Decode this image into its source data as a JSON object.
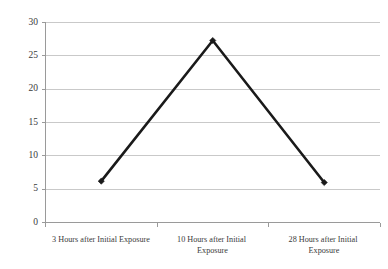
{
  "chart_data": {
    "type": "line",
    "title": "",
    "subtitle": "",
    "xlabel": "",
    "ylabel": "",
    "categories": [
      "3 Hours after Initial Exposure",
      "10 Hours after Initial Exposure",
      "28 Hours after Initial Exposure"
    ],
    "category_lines": [
      [
        "3 Hours after Initial Exposure"
      ],
      [
        "10 Hours after Initial",
        "Exposure"
      ],
      [
        "28 Hours after Initial",
        "Exposure"
      ]
    ],
    "values": [
      6.2,
      27.3,
      6.0
    ],
    "series": [
      {
        "name": "",
        "values": [
          6.2,
          27.3,
          6.0
        ]
      }
    ],
    "ylim": [
      0,
      30
    ],
    "ytick_labels": [
      "0",
      "5",
      "10",
      "15",
      "20",
      "25",
      "30"
    ],
    "ytick_values": [
      0,
      5,
      10,
      15,
      20,
      25,
      30
    ],
    "grid": true,
    "grid_axis": "y",
    "legend": false,
    "legend_position": "none",
    "marker": "diamond",
    "colors": {
      "series_line": "#1a1a1a",
      "marker": "#1a1a1a",
      "gridline": "#c9c9c9",
      "axis": "#9a9a9a",
      "background": "#ffffff",
      "text": "#3a3a3a"
    }
  }
}
